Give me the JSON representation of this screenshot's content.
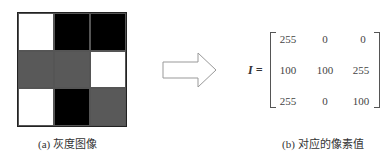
{
  "left_panel": {
    "caption": "(a) 灰度图像",
    "cells": [
      [
        "#ffffff",
        "#000000",
        "#000000"
      ],
      [
        "#595959",
        "#595959",
        "#ffffff"
      ],
      [
        "#ffffff",
        "#000000",
        "#595959"
      ]
    ]
  },
  "arrow": {
    "icon": "right-arrow-icon"
  },
  "right_panel": {
    "label": "I =",
    "matrix": [
      [
        "255",
        "0",
        "0"
      ],
      [
        "100",
        "100",
        "255"
      ],
      [
        "255",
        "0",
        "100"
      ]
    ],
    "caption": "(b) 对应的像素值"
  }
}
